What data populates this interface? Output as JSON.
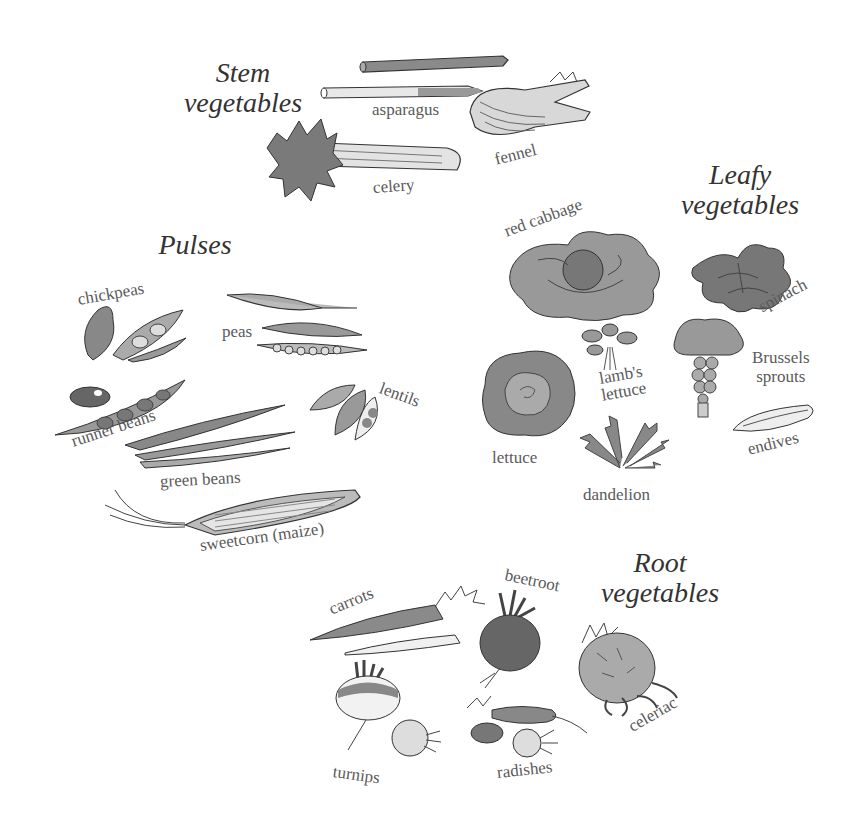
{
  "groups": {
    "stem": {
      "heading_line1": "Stem",
      "heading_line2": "vegetables",
      "items": [
        "asparagus",
        "fennel",
        "celery"
      ]
    },
    "pulses": {
      "heading": "Pulses",
      "items": [
        "chickpeas",
        "peas",
        "lentils",
        "runner beans",
        "green beans",
        "sweetcorn (maize)"
      ]
    },
    "leafy": {
      "heading_line1": "Leafy",
      "heading_line2": "vegetables",
      "items": [
        "red cabbage",
        "spinach",
        "lamb's lettuce",
        "Brussels sprouts",
        "lettuce",
        "endives",
        "dandelion"
      ],
      "lambs_line1": "lamb's",
      "lambs_line2": "lettuce",
      "brussels_line1": "Brussels",
      "brussels_line2": "sprouts"
    },
    "root": {
      "heading_line1": "Root",
      "heading_line2": "vegetables",
      "items": [
        "carrots",
        "beetroot",
        "celeriac",
        "turnips",
        "radishes"
      ]
    }
  },
  "colors": {
    "ink": "#333333",
    "label": "#5a5a5a",
    "wash_dark": "#6e6e6e",
    "wash_mid": "#9a9a9a",
    "wash_light": "#cfcfcf"
  }
}
